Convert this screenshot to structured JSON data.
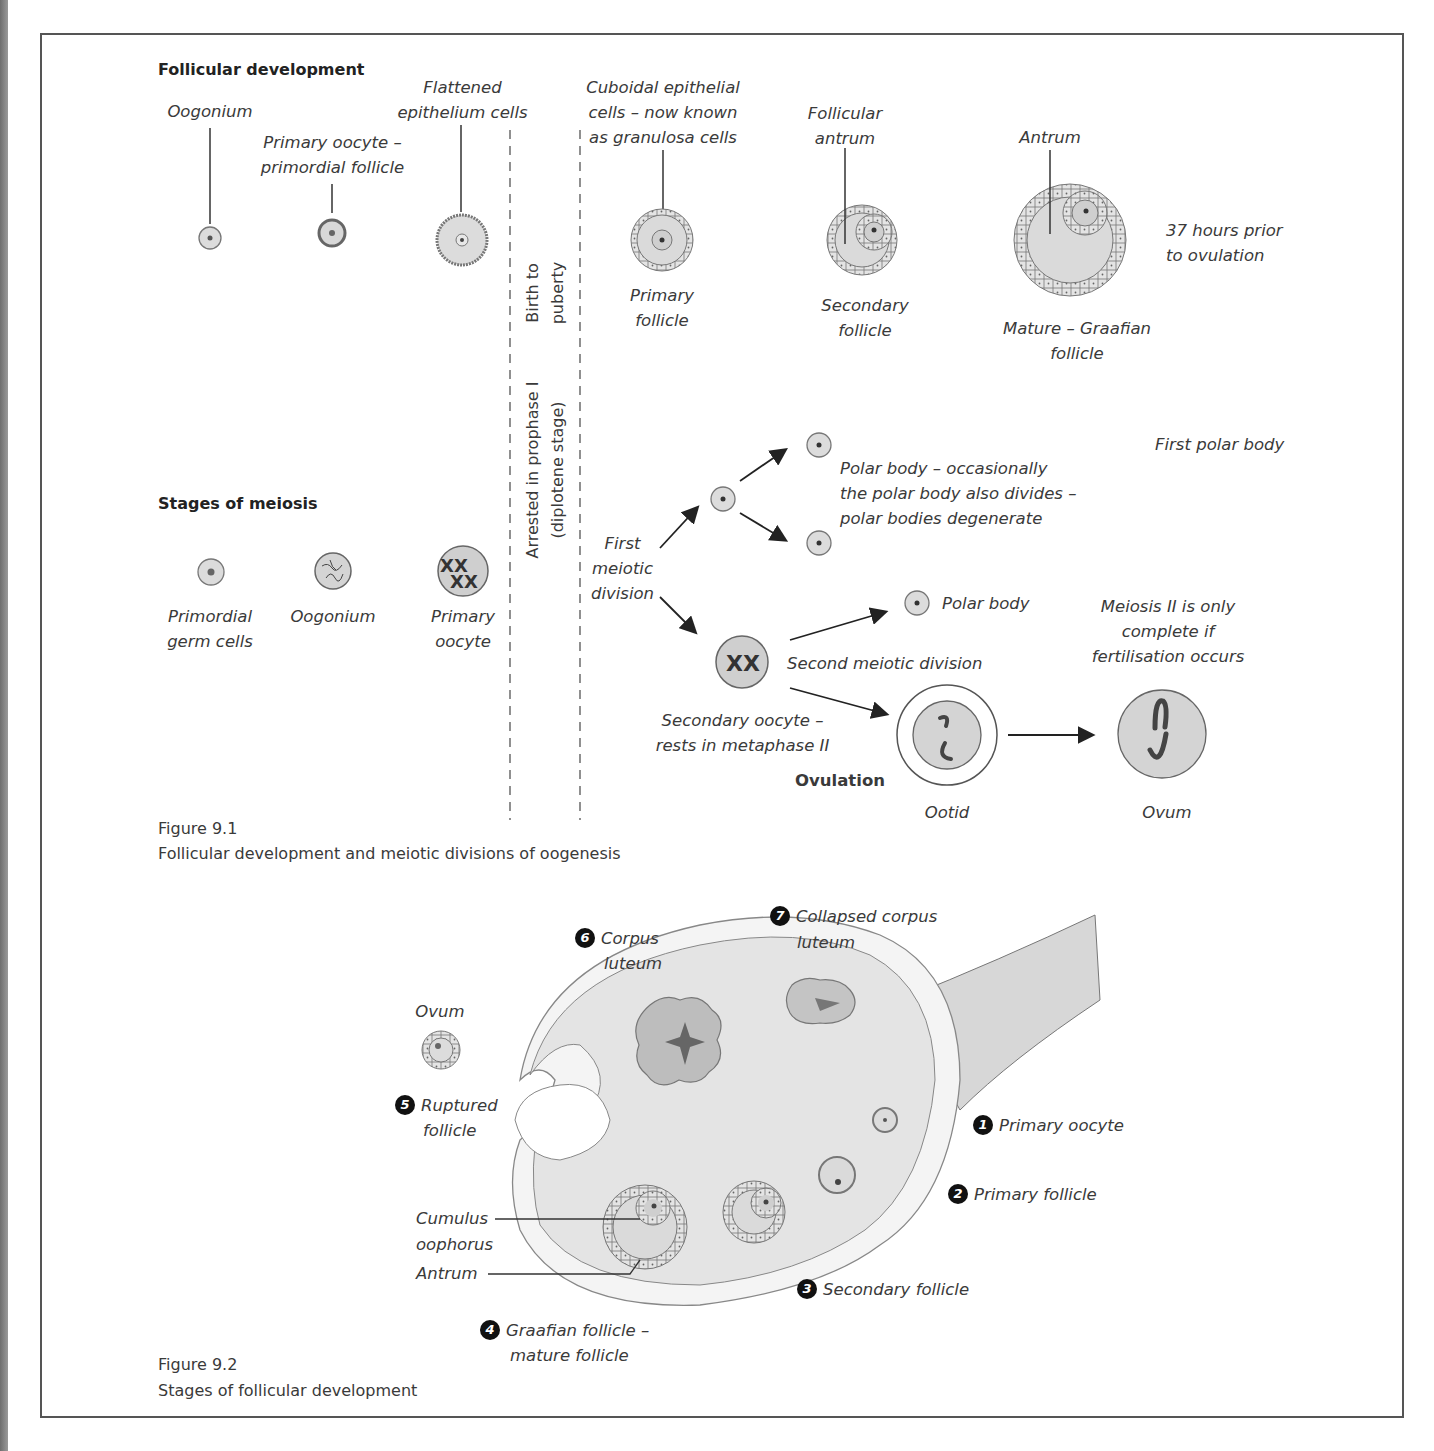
{
  "figure_9_1": {
    "section_follicular": "Follicular development",
    "section_meiosis": "Stages of meiosis",
    "follicular_labels": {
      "oogonium": "Oogonium",
      "primary_oocyte_1": "Primary oocyte –",
      "primary_oocyte_2": "primordial follicle",
      "flattened_1": "Flattened",
      "flattened_2": "epithelium cells",
      "cuboidal_1": "Cuboidal epithelial",
      "cuboidal_2": "cells – now known",
      "cuboidal_3": "as granulosa cells",
      "primary_follicle_1": "Primary",
      "primary_follicle_2": "follicle",
      "follicular_antrum_1": "Follicular",
      "follicular_antrum_2": "antrum",
      "secondary_follicle_1": "Secondary",
      "secondary_follicle_2": "follicle",
      "antrum": "Antrum",
      "mature_1": "Mature – Graafian",
      "mature_2": "follicle",
      "hours_1": "37 hours prior",
      "hours_2": "to ovulation"
    },
    "divider_labels": {
      "birth_1": "Birth to",
      "birth_2": "puberty",
      "arrested_1": "Arrested in prophase I",
      "arrested_2": "(diplotene stage)"
    },
    "meiosis_labels": {
      "primordial_1": "Primordial",
      "primordial_2": "germ cells",
      "oogonium": "Oogonium",
      "primary_oocyte_1": "Primary",
      "primary_oocyte_2": "oocyte",
      "first_meiotic_1": "First",
      "first_meiotic_2": "meiotic",
      "first_meiotic_3": "division",
      "first_polar_body": "First polar body",
      "polar_note_1": "Polar body – occasionally",
      "polar_note_2": "the polar body also divides –",
      "polar_note_3": "polar bodies degenerate",
      "polar_body": "Polar body",
      "second_meiotic": "Second meiotic division",
      "secondary_oocyte_1": "Secondary oocyte –",
      "secondary_oocyte_2": "rests in metaphase II",
      "ovulation": "Ovulation",
      "ootid": "Ootid",
      "ovum": "Ovum",
      "meiosis2_1": "Meiosis II is only",
      "meiosis2_2": "complete if",
      "meiosis2_3": "fertilisation occurs"
    },
    "caption_number": "Figure 9.1",
    "caption_text": "Follicular development and meiotic divisions of oogenesis"
  },
  "figure_9_2": {
    "stages": [
      {
        "num": "1",
        "label": "Primary oocyte"
      },
      {
        "num": "2",
        "label": "Primary follicle"
      },
      {
        "num": "3",
        "label": "Secondary follicle"
      },
      {
        "num": "4",
        "label_1": "Graafian follicle –",
        "label_2": "mature follicle"
      },
      {
        "num": "5",
        "label_1": "Ruptured",
        "label_2": "follicle"
      },
      {
        "num": "6",
        "label_1": "Corpus",
        "label_2": "luteum"
      },
      {
        "num": "7",
        "label_1": "Collapsed corpus",
        "label_2": "luteum"
      }
    ],
    "ovum": "Ovum",
    "cumulus_1": "Cumulus",
    "cumulus_2": "oophorus",
    "antrum": "Antrum",
    "caption_number": "Figure 9.2",
    "caption_text": "Stages of follicular development"
  },
  "colors": {
    "frame": "#555555",
    "cell_fill": "#d9d9d9",
    "ovary_fill": "#e6e6e6",
    "corpus_fill": "#b8b8b8",
    "text": "#3a3a3a"
  }
}
